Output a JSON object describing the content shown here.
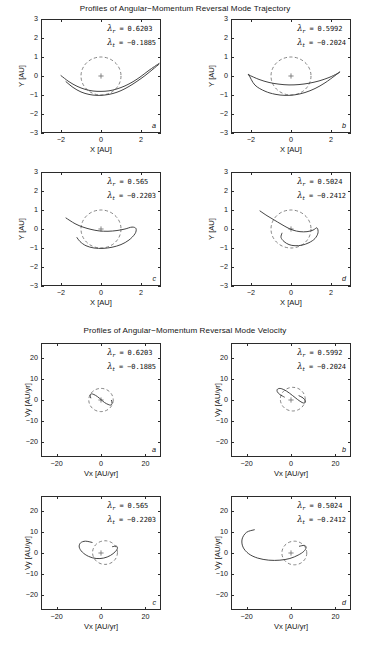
{
  "figure": {
    "groups": [
      {
        "id": "trajectory",
        "title": "Profiles of Angular−Momentum Reversal Mode Trajectory",
        "xlabel": "X  [AU]",
        "ylabel": "Y  [AU]",
        "xticks": [
          "-2",
          "0",
          "2"
        ],
        "yticks": [
          "3",
          "2",
          "1",
          "0",
          "-1",
          "-2",
          "-3"
        ],
        "xlim": [
          -3,
          3
        ],
        "ylim": [
          -3,
          3
        ],
        "panels": [
          {
            "letter": "a",
            "lambda_r_label": "λ",
            "lambda_r_sub": "r",
            "lambda_r_value": "=  0.6203",
            "lambda_t_label": "λ",
            "lambda_t_sub": "t",
            "lambda_t_value": "= −0.1885"
          },
          {
            "letter": "b",
            "lambda_r_label": "λ",
            "lambda_r_sub": "r",
            "lambda_r_value": "=  0.5992",
            "lambda_t_label": "λ",
            "lambda_t_sub": "t",
            "lambda_t_value": "= −0.2024"
          },
          {
            "letter": "c",
            "lambda_r_label": "λ",
            "lambda_r_sub": "r",
            "lambda_r_value": "=  0.565",
            "lambda_t_label": "λ",
            "lambda_t_sub": "t",
            "lambda_t_value": "= −0.2203"
          },
          {
            "letter": "d",
            "lambda_r_label": "λ",
            "lambda_r_sub": "r",
            "lambda_r_value": "=  0.5024",
            "lambda_t_label": "λ",
            "lambda_t_sub": "t",
            "lambda_t_value": "= −0.2412"
          }
        ]
      },
      {
        "id": "velocity",
        "title": "Profiles of Angular−Momentum Reversal Mode Velocity",
        "xlabel": "Vx  [AU/yr]",
        "ylabel": "Vy  [AU/yr]",
        "xticks": [
          "-20",
          "0",
          "20"
        ],
        "yticks": [
          "20",
          "10",
          "0",
          "-10",
          "-20"
        ],
        "xlim": [
          -27,
          27
        ],
        "ylim": [
          -27,
          27
        ],
        "panels": [
          {
            "letter": "a",
            "lambda_r_label": "λ",
            "lambda_r_sub": "r",
            "lambda_r_value": "=  0.6203",
            "lambda_t_label": "λ",
            "lambda_t_sub": "t",
            "lambda_t_value": "= −0.1885"
          },
          {
            "letter": "b",
            "lambda_r_label": "λ",
            "lambda_r_sub": "r",
            "lambda_r_value": "=  0.5992",
            "lambda_t_label": "λ",
            "lambda_t_sub": "t",
            "lambda_t_value": "= −0.2024"
          },
          {
            "letter": "c",
            "lambda_r_label": "λ",
            "lambda_r_sub": "r",
            "lambda_r_value": "=  0.565",
            "lambda_t_label": "λ",
            "lambda_t_sub": "t",
            "lambda_t_value": "= −0.2203"
          },
          {
            "letter": "d",
            "lambda_r_label": "λ",
            "lambda_r_sub": "r",
            "lambda_r_value": "=  0.5024",
            "lambda_t_label": "λ",
            "lambda_t_sub": "t",
            "lambda_t_value": "= −0.2412"
          }
        ]
      }
    ]
  },
  "chart_data": [
    {
      "type": "line",
      "panel": "traj-a",
      "title": "Profiles of Angular−Momentum Reversal Mode Trajectory",
      "xlabel": "X  [AU]",
      "ylabel": "Y  [AU]",
      "xlim": [
        -3,
        3
      ],
      "ylim": [
        -3,
        3
      ],
      "grid": false,
      "legend": false,
      "annotations": [
        "λ_r =  0.6203",
        "λ_t = −0.1885",
        "a"
      ],
      "series": [
        {
          "name": "unit-circle-dashed",
          "style": "dashed",
          "type": "circle",
          "center": [
            0,
            0
          ],
          "radius": 1.0
        },
        {
          "name": "origin-marker",
          "style": "plus",
          "x": [
            0
          ],
          "y": [
            0
          ]
        },
        {
          "name": "trajectory-1",
          "style": "solid",
          "x": [
            -2.0,
            -1.6,
            -1.2,
            -0.8,
            -0.4,
            0.0,
            0.4,
            0.8,
            1.2,
            1.6,
            2.0,
            2.4,
            2.9
          ],
          "y": [
            0.02,
            -0.3,
            -0.54,
            -0.7,
            -0.79,
            -0.81,
            -0.78,
            -0.68,
            -0.52,
            -0.3,
            -0.02,
            0.3,
            0.66
          ]
        },
        {
          "name": "trajectory-2",
          "style": "solid",
          "x": [
            -1.75,
            -1.4,
            -1.0,
            -0.6,
            -0.2,
            0.2,
            0.6,
            1.0,
            1.4,
            1.8,
            2.2,
            2.6,
            2.9
          ],
          "y": [
            -0.3,
            -0.6,
            -0.84,
            -0.97,
            -1.02,
            -1.0,
            -0.92,
            -0.77,
            -0.55,
            -0.28,
            0.02,
            0.36,
            0.62
          ]
        }
      ]
    },
    {
      "type": "line",
      "panel": "traj-b",
      "xlabel": "X  [AU]",
      "ylabel": "Y  [AU]",
      "xlim": [
        -3,
        3
      ],
      "ylim": [
        -3,
        3
      ],
      "grid": false,
      "legend": false,
      "annotations": [
        "λ_r =  0.5992",
        "λ_t = −0.2024",
        "b"
      ],
      "series": [
        {
          "name": "unit-circle-dashed",
          "style": "dashed",
          "type": "circle",
          "center": [
            0,
            0
          ],
          "radius": 1.0
        },
        {
          "name": "origin-marker",
          "style": "plus",
          "x": [
            0
          ],
          "y": [
            0
          ]
        },
        {
          "name": "trajectory-loop",
          "style": "solid",
          "closed": true,
          "x": [
            -2.1,
            -1.6,
            -1.1,
            -0.6,
            -0.1,
            0.4,
            0.9,
            1.4,
            1.9,
            2.3,
            2.45,
            2.2,
            1.7,
            1.2,
            0.7,
            0.2,
            -0.3,
            -0.8,
            -1.3,
            -1.8,
            -2.1
          ],
          "y": [
            0.05,
            -0.18,
            -0.34,
            -0.43,
            -0.47,
            -0.45,
            -0.38,
            -0.26,
            -0.08,
            0.12,
            0.22,
            0.02,
            -0.36,
            -0.66,
            -0.87,
            -0.99,
            -1.02,
            -0.96,
            -0.8,
            -0.48,
            0.05
          ]
        }
      ]
    },
    {
      "type": "line",
      "panel": "traj-c",
      "xlabel": "X  [AU]",
      "ylabel": "Y  [AU]",
      "xlim": [
        -3,
        3
      ],
      "ylim": [
        -3,
        3
      ],
      "grid": false,
      "legend": false,
      "annotations": [
        "λ_r =  0.565",
        "λ_t = −0.2203",
        "c"
      ],
      "series": [
        {
          "name": "unit-circle-dashed",
          "style": "dashed",
          "type": "circle",
          "center": [
            0,
            0
          ],
          "radius": 1.0
        },
        {
          "name": "origin-marker",
          "style": "plus",
          "x": [
            0
          ],
          "y": [
            0
          ]
        },
        {
          "name": "trajectory-loop",
          "style": "solid",
          "x": [
            -1.75,
            -1.3,
            -0.9,
            -0.5,
            -0.1,
            0.35,
            0.8,
            1.2,
            1.55,
            1.75,
            1.7,
            1.4,
            1.0,
            0.55,
            0.1,
            -0.35,
            -0.75,
            -1.05,
            -1.2
          ],
          "y": [
            0.58,
            0.28,
            0.1,
            -0.02,
            -0.1,
            -0.12,
            -0.08,
            0.0,
            0.1,
            0.02,
            -0.25,
            -0.58,
            -0.82,
            -0.96,
            -1.02,
            -1.0,
            -0.88,
            -0.66,
            -0.45
          ]
        }
      ]
    },
    {
      "type": "line",
      "panel": "traj-d",
      "xlabel": "X  [AU]",
      "ylabel": "Y  [AU]",
      "xlim": [
        -3,
        3
      ],
      "ylim": [
        -3,
        3
      ],
      "grid": false,
      "legend": false,
      "annotations": [
        "λ_r =  0.5024",
        "λ_t = −0.2412",
        "d"
      ],
      "series": [
        {
          "name": "unit-circle-dashed",
          "style": "dashed",
          "type": "circle",
          "center": [
            0,
            0
          ],
          "radius": 1.0
        },
        {
          "name": "origin-marker",
          "style": "plus",
          "x": [
            0
          ],
          "y": [
            0
          ]
        },
        {
          "name": "trajectory-loop",
          "style": "solid",
          "x": [
            -1.55,
            -1.2,
            -0.85,
            -0.5,
            -0.2,
            0.1,
            0.45,
            0.8,
            1.1,
            1.3,
            1.35,
            1.2,
            0.9,
            0.55,
            0.2,
            -0.1,
            -0.35,
            -0.5,
            -0.45
          ],
          "y": [
            0.95,
            0.7,
            0.48,
            0.26,
            0.08,
            -0.06,
            -0.14,
            -0.14,
            -0.06,
            0.06,
            -0.2,
            -0.5,
            -0.72,
            -0.85,
            -0.88,
            -0.82,
            -0.66,
            -0.44,
            -0.22
          ]
        }
      ]
    },
    {
      "type": "line",
      "panel": "vel-a",
      "title": "Profiles of Angular−Momentum Reversal Mode Velocity",
      "xlabel": "Vx  [AU/yr]",
      "ylabel": "Vy  [AU/yr]",
      "xlim": [
        -27,
        27
      ],
      "ylim": [
        -27,
        27
      ],
      "grid": false,
      "legend": false,
      "annotations": [
        "λ_r =  0.6203",
        "λ_t = −0.1885",
        "a"
      ],
      "series": [
        {
          "name": "velocity-circle-dashed",
          "style": "dashed",
          "type": "circle",
          "center": [
            0,
            0
          ],
          "radius": 5.5
        },
        {
          "name": "origin-marker",
          "style": "plus",
          "x": [
            0
          ],
          "y": [
            0
          ]
        },
        {
          "name": "velocity-curve",
          "style": "solid",
          "x": [
            -4.6,
            -4.9,
            -4.4,
            -3.2,
            -1.6,
            0.0,
            1.6,
            3.2,
            4.4,
            5.0,
            4.7
          ],
          "y": [
            1.0,
            2.3,
            2.9,
            2.6,
            1.6,
            0.2,
            -1.2,
            -2.1,
            -2.4,
            -1.6,
            -0.2
          ]
        }
      ]
    },
    {
      "type": "line",
      "panel": "vel-b",
      "xlabel": "Vx  [AU/yr]",
      "ylabel": "Vy  [AU/yr]",
      "xlim": [
        -27,
        27
      ],
      "ylim": [
        -27,
        27
      ],
      "grid": false,
      "legend": false,
      "annotations": [
        "λ_r =  0.5992",
        "λ_t = −0.2024",
        "b"
      ],
      "series": [
        {
          "name": "velocity-circle-dashed",
          "style": "dashed",
          "type": "circle",
          "center": [
            0.8,
            0.4
          ],
          "radius": 5.6
        },
        {
          "name": "origin-marker",
          "style": "plus",
          "x": [
            0
          ],
          "y": [
            0
          ]
        },
        {
          "name": "velocity-curve",
          "style": "solid",
          "x": [
            -3.0,
            -5.0,
            -6.2,
            -6.0,
            -4.4,
            -2.0,
            0.6,
            3.0,
            5.0,
            6.2,
            6.4,
            5.4,
            3.6
          ],
          "y": [
            1.4,
            2.6,
            4.0,
            5.2,
            5.4,
            4.2,
            2.2,
            0.2,
            -1.2,
            -1.4,
            -0.4,
            1.0,
            2.0
          ]
        }
      ]
    },
    {
      "type": "line",
      "panel": "vel-c",
      "xlabel": "Vx  [AU/yr]",
      "ylabel": "Vy  [AU/yr]",
      "xlim": [
        -27,
        27
      ],
      "ylim": [
        -27,
        27
      ],
      "grid": false,
      "legend": false,
      "annotations": [
        "λ_r =  0.565",
        "λ_t = −0.2203",
        "c"
      ],
      "series": [
        {
          "name": "velocity-circle-dashed",
          "style": "dashed",
          "type": "circle",
          "center": [
            1.8,
            0.2
          ],
          "radius": 5.6
        },
        {
          "name": "origin-marker",
          "style": "plus",
          "x": [
            0
          ],
          "y": [
            0
          ]
        },
        {
          "name": "velocity-curve",
          "style": "solid",
          "x": [
            -4.0,
            -7.0,
            -9.2,
            -9.8,
            -8.4,
            -5.6,
            -2.2,
            1.2,
            4.2,
            6.4,
            7.4,
            7.0,
            5.2
          ],
          "y": [
            5.0,
            5.6,
            4.8,
            2.8,
            0.4,
            -1.6,
            -2.6,
            -2.4,
            -1.2,
            0.6,
            2.2,
            3.2,
            3.0
          ]
        }
      ]
    },
    {
      "type": "line",
      "panel": "vel-d",
      "xlabel": "Vx  [AU/yr]",
      "ylabel": "Vy  [AU/yr]",
      "xlim": [
        -27,
        27
      ],
      "ylim": [
        -27,
        27
      ],
      "grid": false,
      "legend": false,
      "annotations": [
        "λ_r =  0.5024",
        "λ_t = −0.2412",
        "d"
      ],
      "series": [
        {
          "name": "velocity-circle-dashed",
          "style": "dashed",
          "type": "circle",
          "center": [
            1.5,
            0.0
          ],
          "radius": 5.6
        },
        {
          "name": "origin-marker",
          "style": "plus",
          "x": [
            0
          ],
          "y": [
            0
          ]
        },
        {
          "name": "velocity-curve",
          "style": "solid",
          "x": [
            -16.5,
            -20.0,
            -22.0,
            -21.6,
            -19.0,
            -15.0,
            -10.0,
            -5.0,
            -0.5,
            3.2,
            5.8,
            6.8,
            6.0,
            3.8
          ],
          "y": [
            11.0,
            9.8,
            6.6,
            2.8,
            -0.4,
            -2.4,
            -3.4,
            -3.4,
            -2.6,
            -1.0,
            0.8,
            2.6,
            3.6,
            3.2
          ]
        }
      ]
    }
  ]
}
